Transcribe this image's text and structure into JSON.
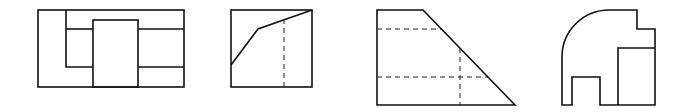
{
  "figure": {
    "type": "technical-drawing-views",
    "stroke_color": "#111111",
    "background": "#ffffff",
    "views": [
      {
        "id": "view-1",
        "label": "",
        "description": "Rectangle with nested L-shape and central raised block"
      },
      {
        "id": "view-2",
        "label": "",
        "description": "Square with sloped polyline and hidden vertical edge"
      },
      {
        "id": "view-3",
        "label": "",
        "description": "Trapezoid with hidden horizontal and vertical edges"
      },
      {
        "id": "view-4",
        "label": "",
        "description": "Rounded-corner profile with step and rectangular cut"
      }
    ]
  }
}
